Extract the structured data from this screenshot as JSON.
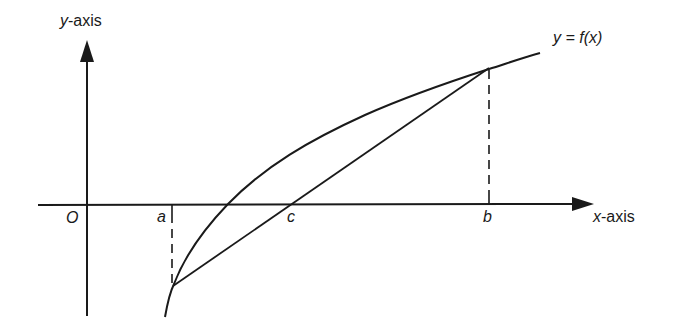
{
  "diagram": {
    "labels": {
      "y_axis_var": "y",
      "y_axis_suffix": "-axis",
      "x_axis_var": "x",
      "x_axis_suffix": "-axis",
      "origin": "O",
      "point_a": "a",
      "point_b": "b",
      "point_c": "c",
      "curve": "y = f(x)"
    },
    "elements": [
      {
        "type": "axis",
        "name": "x-axis",
        "direction": "horizontal",
        "arrow": "right"
      },
      {
        "type": "axis",
        "name": "y-axis",
        "direction": "vertical",
        "arrow": "up"
      },
      {
        "type": "curve",
        "name": "y = f(x)",
        "shape": "concave increasing"
      },
      {
        "type": "chord",
        "from": "(a, f(a))",
        "to": "(b, f(b))",
        "crosses_x_axis_at": "c"
      },
      {
        "type": "dashed-line",
        "from": "a on x-axis",
        "to": "(a, f(a))"
      },
      {
        "type": "dashed-line",
        "from": "b on x-axis",
        "to": "(b, f(b))"
      }
    ],
    "colors": {
      "stroke": "#1a1a1a",
      "background": "#ffffff"
    }
  }
}
